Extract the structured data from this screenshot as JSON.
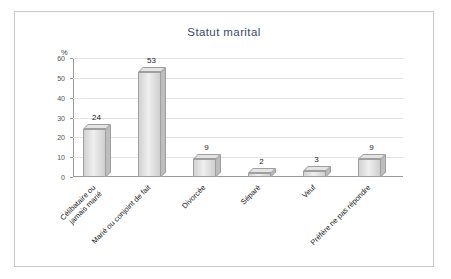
{
  "chart_data": {
    "type": "bar",
    "title": "Statut marital",
    "xlabel": "",
    "ylabel": "%",
    "ylim": [
      0,
      60
    ],
    "yticks": [
      0,
      10,
      20,
      30,
      40,
      50,
      60
    ],
    "grid": true,
    "legend": "none",
    "categories": [
      "Célibataire ou\njamais marié",
      "Marié ou conjoint de fait",
      "Divorcée",
      "Séparé",
      "Veuf",
      "Préfère ne pas répondre"
    ],
    "values": [
      24,
      53,
      9,
      2,
      3,
      9
    ],
    "value_labels": [
      "24",
      "53",
      "9",
      "2",
      "3",
      "9"
    ],
    "bar_color": "#dcdcdc",
    "border_color": "#9f9f9f"
  }
}
